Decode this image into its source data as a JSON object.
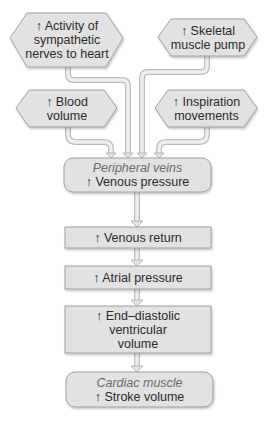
{
  "diagram": {
    "colors": {
      "shape_fill": "#e2e2e2",
      "shape_stroke": "#9a9a9a",
      "connector": "#d0d0d0",
      "text": "#2a2a2a",
      "italic_text": "#6a6a6a"
    },
    "inputs": [
      {
        "id": "sympathetic",
        "shape": "hexagon",
        "lines": [
          "↑ Activity of",
          "sympathetic",
          "nerves to heart"
        ]
      },
      {
        "id": "skeletal",
        "shape": "hexagon",
        "lines": [
          "↑ Skeletal",
          "muscle pump"
        ]
      },
      {
        "id": "blood",
        "shape": "hexagon",
        "lines": [
          "↑ Blood",
          "volume"
        ]
      },
      {
        "id": "inspiration",
        "shape": "hexagon",
        "lines": [
          "↑ Inspiration",
          "movements"
        ]
      }
    ],
    "chain": [
      {
        "id": "peripheral",
        "shape": "rounded",
        "site": "Peripheral  veins",
        "lines": [
          "↑ Venous pressure"
        ]
      },
      {
        "id": "venous-return",
        "shape": "rect",
        "lines": [
          "↑ Venous return"
        ]
      },
      {
        "id": "atrial",
        "shape": "rect",
        "lines": [
          "↑ Atrial pressure"
        ]
      },
      {
        "id": "edv",
        "shape": "rect",
        "lines": [
          "↑ End–diastolic",
          "ventricular",
          "volume"
        ]
      },
      {
        "id": "cardiac",
        "shape": "rounded",
        "site": "Cardiac  muscle",
        "lines": [
          "↑ Stroke volume"
        ]
      }
    ]
  }
}
